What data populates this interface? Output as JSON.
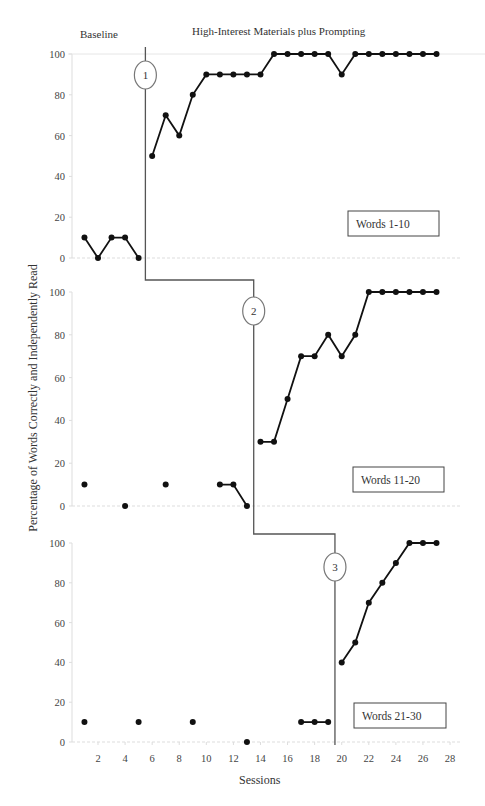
{
  "header": {
    "baseline_label": "Baseline",
    "treatment_label": "High-Interest Materials plus Prompting"
  },
  "axes": {
    "ylabel": "Percentage of Words Correctly and Independently Read",
    "xlabel": "Sessions",
    "yticks": [
      0,
      20,
      40,
      60,
      80,
      100
    ],
    "xticks": [
      2,
      4,
      6,
      8,
      10,
      12,
      14,
      16,
      18,
      20,
      22,
      24,
      26,
      28
    ]
  },
  "colors": {
    "line": "#111111",
    "grid": "#dddddd",
    "phase_line": "#555555"
  },
  "chart_data": {
    "type": "line",
    "xlabel": "Sessions",
    "ylabel": "Percentage of Words Correctly and Independently Read",
    "xlim": [
      0,
      29
    ],
    "ylim": [
      0,
      100
    ],
    "grid": false,
    "phases": [
      "Baseline",
      "High-Interest Materials plus Prompting"
    ],
    "panels": [
      {
        "label": "Words 1-10",
        "phase_change_marker": "1",
        "phase_change_after_session": 5.5,
        "baseline": {
          "x": [
            1,
            2,
            3,
            4,
            5
          ],
          "y": [
            10,
            0,
            10,
            10,
            0
          ],
          "connected": true
        },
        "treatment": {
          "x": [
            6,
            7,
            8,
            9,
            10,
            11,
            12,
            13,
            14,
            15,
            16,
            17,
            18,
            19,
            20,
            21,
            22,
            23,
            24,
            25,
            26,
            27
          ],
          "y": [
            50,
            70,
            60,
            80,
            90,
            90,
            90,
            90,
            90,
            100,
            100,
            100,
            100,
            100,
            90,
            100,
            100,
            100,
            100,
            100,
            100,
            100
          ]
        }
      },
      {
        "label": "Words 11-20",
        "phase_change_marker": "2",
        "phase_change_after_session": 13.5,
        "baseline": {
          "x": [
            1,
            4,
            7,
            11,
            12,
            13
          ],
          "y": [
            10,
            0,
            10,
            10,
            10,
            0
          ],
          "segments": [
            [
              11,
              12,
              13
            ]
          ]
        },
        "treatment": {
          "x": [
            14,
            15,
            16,
            17,
            18,
            19,
            20,
            21,
            22,
            23,
            24,
            25,
            26,
            27
          ],
          "y": [
            30,
            30,
            50,
            70,
            70,
            80,
            70,
            80,
            100,
            100,
            100,
            100,
            100,
            100
          ]
        }
      },
      {
        "label": "Words 21-30",
        "phase_change_marker": "3",
        "phase_change_after_session": 19.5,
        "baseline": {
          "x": [
            1,
            5,
            9,
            13,
            17,
            18,
            19
          ],
          "y": [
            10,
            10,
            10,
            0,
            10,
            10,
            10
          ],
          "segments": [
            [
              17,
              18,
              19
            ]
          ]
        },
        "treatment": {
          "x": [
            20,
            21,
            22,
            23,
            24,
            25,
            26,
            27
          ],
          "y": [
            40,
            50,
            70,
            80,
            90,
            100,
            100,
            100
          ]
        }
      }
    ]
  }
}
